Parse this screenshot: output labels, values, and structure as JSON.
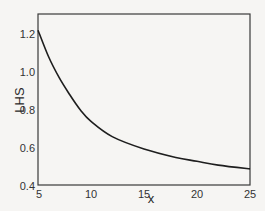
{
  "chart_data": {
    "type": "line",
    "title": "",
    "xlabel": "x",
    "ylabel": "LHS",
    "xlim": [
      5,
      25
    ],
    "ylim": [
      0.4,
      1.3
    ],
    "xticks": [
      5,
      10,
      15,
      20,
      25
    ],
    "yticks": [
      0.4,
      0.6,
      0.8,
      1.0,
      1.2
    ],
    "xtick_labels": [
      "5",
      "10",
      "15",
      "20",
      "25"
    ],
    "ytick_labels": [
      "0.4",
      "0.6",
      "0.8",
      "1.0",
      "1.2"
    ],
    "grid": false,
    "legend": null,
    "series": [
      {
        "name": "LHS",
        "color": "#1e1e1e",
        "x": [
          5,
          6,
          7,
          8,
          9,
          10,
          12,
          15,
          18,
          20,
          22,
          25
        ],
        "y": [
          1.22,
          1.08,
          0.97,
          0.88,
          0.8,
          0.74,
          0.66,
          0.595,
          0.55,
          0.53,
          0.51,
          0.49
        ]
      }
    ]
  },
  "colors": {
    "background": "#f6f5f3",
    "frame": "#3a3a3a",
    "line": "#1e1e1e"
  }
}
